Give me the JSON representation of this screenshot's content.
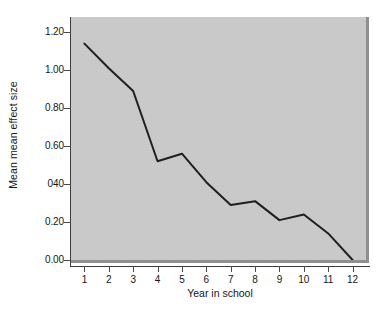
{
  "chart_data": {
    "type": "line",
    "title": "",
    "xlabel": "Year in school",
    "ylabel": "Mean mean effect size",
    "x": [
      1,
      2,
      3,
      4,
      5,
      6,
      7,
      8,
      9,
      10,
      11,
      12
    ],
    "categories": [
      "1",
      "2",
      "3",
      "4",
      "5",
      "6",
      "7",
      "8",
      "9",
      "10",
      "11",
      "12"
    ],
    "values": [
      1.14,
      1.01,
      0.89,
      0.52,
      0.56,
      0.41,
      0.29,
      0.31,
      0.21,
      0.24,
      0.14,
      0.0
    ],
    "series": [
      {
        "name": "Mean mean effect size",
        "values": [
          1.14,
          1.01,
          0.89,
          0.52,
          0.56,
          0.41,
          0.29,
          0.31,
          0.21,
          0.24,
          0.14,
          0.0
        ]
      }
    ],
    "xlim": [
      0.45,
      12.55
    ],
    "ylim": [
      0.0,
      1.28
    ],
    "grid": false,
    "legend": "none",
    "x_tick_labels": [
      "1",
      "2",
      "3",
      "4",
      "5",
      "6",
      "7",
      "8",
      "9",
      "10",
      "11",
      "12"
    ],
    "y_ticks": [
      0.0,
      0.2,
      0.4,
      0.6,
      0.8,
      1.0,
      1.2
    ],
    "y_tick_labels": [
      "0.00",
      "0.20",
      "040",
      "0.60",
      "0.80",
      "1.00",
      "1.20"
    ],
    "line_color": "#1f1f1f",
    "plot_background_color": "#c9c9c9",
    "figure_background_color": "#ffffff"
  },
  "caption": {
    "fragment": ""
  }
}
